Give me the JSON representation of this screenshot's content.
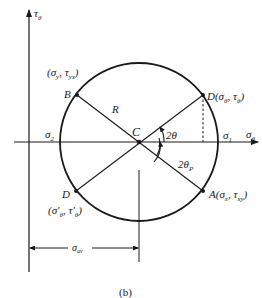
{
  "figure": {
    "caption": "(b)",
    "type": "Mohr's circle for plane stress"
  },
  "axes": {
    "vertical_label": "τ",
    "vertical_sub": "θ",
    "horizontal_label": "σ",
    "horizontal_sub": "θ"
  },
  "points": {
    "C": {
      "name": "C"
    },
    "D": {
      "name": "D",
      "coord": "(σ",
      "sub1": "θ",
      "mid": ", τ",
      "sub2": "θ",
      "end": ")"
    },
    "B": {
      "name": "B",
      "coord": "(σ",
      "sub1": "y",
      "mid": ", τ",
      "sub2": "yx",
      "end": ")"
    },
    "A": {
      "name": "A",
      "coord": "(σ",
      "sub1": "x",
      "mid": ", τ",
      "sub2": "xy",
      "end": ")"
    },
    "Dprime": {
      "name": "D",
      "coord": "(σ′",
      "sub1": "θ",
      "mid": ", τ′",
      "sub2": "θ",
      "end": ")"
    }
  },
  "labels": {
    "radius": "R",
    "sigma1": "σ",
    "sigma1_sub": "1",
    "sigma2": "σ",
    "sigma2_sub": "2",
    "angle_2theta": "2θ",
    "angle_2thetaP": "2θ",
    "angle_2thetaP_sub": "P",
    "sigma_av": "σ",
    "sigma_av_sub": "av"
  },
  "colors": {
    "line": "#1a1a1a",
    "background": "#ffffff"
  }
}
